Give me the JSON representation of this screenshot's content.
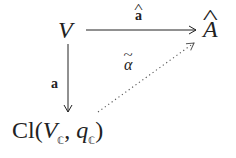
{
  "diagram": {
    "type": "commutative-diagram",
    "nodes": {
      "V": {
        "label": "V"
      },
      "A_hat": {
        "base": "A",
        "accent": "^"
      },
      "Cl": {
        "prefix": "Cl(",
        "V": "V",
        "V_sub": "ℂ",
        "comma": ", ",
        "q": "q",
        "q_sub": "ℂ",
        "suffix": ")"
      }
    },
    "arrows": [
      {
        "from": "V",
        "to": "A_hat",
        "style": "solid",
        "label_base": "a",
        "label_accent": "^"
      },
      {
        "from": "V",
        "to": "Cl",
        "style": "solid",
        "label": "a"
      },
      {
        "from": "Cl",
        "to": "A_hat",
        "style": "dotted",
        "label_base": "α",
        "label_accent": "~"
      }
    ],
    "colors": {
      "ink": "#222222",
      "dotted": "#555555",
      "background": "#ffffff"
    }
  }
}
